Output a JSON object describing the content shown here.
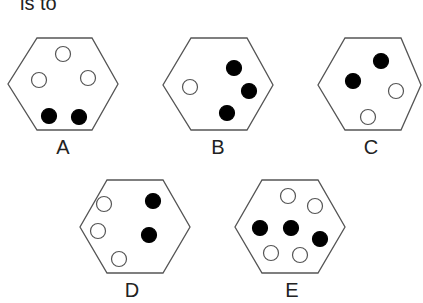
{
  "question_fragment": "is to",
  "options": [
    {
      "label": "A",
      "hex": [
        [
          37,
          38
        ],
        [
          92,
          38
        ],
        [
          118,
          84
        ],
        [
          92,
          130
        ],
        [
          37,
          130
        ],
        [
          8,
          84
        ]
      ],
      "circles": [
        {
          "x": 63,
          "y": 54,
          "f": "white"
        },
        {
          "x": 39,
          "y": 80,
          "f": "white"
        },
        {
          "x": 88,
          "y": 78,
          "f": "white"
        },
        {
          "x": 49,
          "y": 116,
          "f": "black"
        },
        {
          "x": 79,
          "y": 117,
          "f": "black"
        }
      ],
      "lx": 63,
      "ly": 136
    },
    {
      "label": "B",
      "hex": [
        [
          191,
          38
        ],
        [
          247,
          38
        ],
        [
          273,
          85
        ],
        [
          247,
          130
        ],
        [
          191,
          130
        ],
        [
          163,
          85
        ]
      ],
      "circles": [
        {
          "x": 190,
          "y": 87,
          "f": "white"
        },
        {
          "x": 234,
          "y": 68,
          "f": "black"
        },
        {
          "x": 249,
          "y": 91,
          "f": "black"
        },
        {
          "x": 227,
          "y": 113,
          "f": "black"
        }
      ],
      "lx": 218,
      "ly": 136
    },
    {
      "label": "C",
      "hex": [
        [
          345,
          38
        ],
        [
          401,
          38
        ],
        [
          421,
          85
        ],
        [
          401,
          130
        ],
        [
          345,
          130
        ],
        [
          318,
          85
        ]
      ],
      "circles": [
        {
          "x": 381,
          "y": 61,
          "f": "black"
        },
        {
          "x": 353,
          "y": 81,
          "f": "black"
        },
        {
          "x": 396,
          "y": 91,
          "f": "white"
        },
        {
          "x": 368,
          "y": 117,
          "f": "white"
        }
      ],
      "lx": 371,
      "ly": 136
    },
    {
      "label": "D",
      "hex": [
        [
          107,
          180
        ],
        [
          163,
          180
        ],
        [
          190,
          227
        ],
        [
          163,
          273
        ],
        [
          107,
          273
        ],
        [
          80,
          227
        ]
      ],
      "circles": [
        {
          "x": 104,
          "y": 204,
          "f": "white"
        },
        {
          "x": 98,
          "y": 231,
          "f": "white"
        },
        {
          "x": 119,
          "y": 259,
          "f": "white"
        },
        {
          "x": 153,
          "y": 201,
          "f": "black"
        },
        {
          "x": 149,
          "y": 235,
          "f": "black"
        }
      ],
      "lx": 132,
      "ly": 279
    },
    {
      "label": "E",
      "hex": [
        [
          262,
          180
        ],
        [
          318,
          180
        ],
        [
          345,
          227
        ],
        [
          318,
          273
        ],
        [
          262,
          273
        ],
        [
          235,
          227
        ]
      ],
      "circles": [
        {
          "x": 288,
          "y": 196,
          "f": "white"
        },
        {
          "x": 315,
          "y": 206,
          "f": "white"
        },
        {
          "x": 271,
          "y": 253,
          "f": "white"
        },
        {
          "x": 300,
          "y": 255,
          "f": "white"
        },
        {
          "x": 260,
          "y": 228,
          "f": "black"
        },
        {
          "x": 291,
          "y": 228,
          "f": "black"
        },
        {
          "x": 320,
          "y": 239,
          "f": "black"
        }
      ],
      "lx": 292,
      "ly": 279
    }
  ]
}
